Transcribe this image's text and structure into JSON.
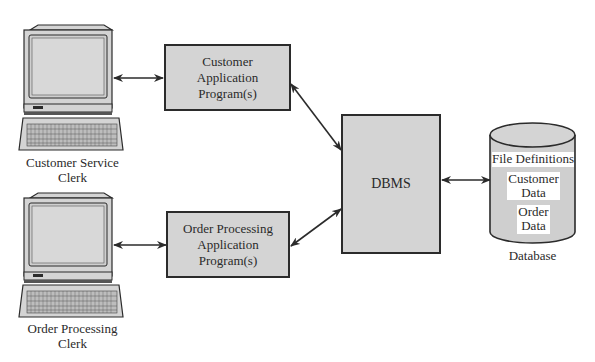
{
  "diagram": {
    "terminals": [
      {
        "id": "customer-service",
        "label_line1": "Customer Service",
        "label_line2": "Clerk"
      },
      {
        "id": "order-processing",
        "label_line1": "Order Processing",
        "label_line2": "Clerk"
      }
    ],
    "programs": [
      {
        "id": "customer-app",
        "line1": "Customer",
        "line2": "Application",
        "line3": "Program(s)"
      },
      {
        "id": "order-app",
        "line1": "Order Processing",
        "line2": "Application",
        "line3": "Program(s)"
      }
    ],
    "dbms": {
      "label": "DBMS"
    },
    "database": {
      "label": "Database",
      "contents": {
        "file_definitions": "File Definitions",
        "customer_data_line1": "Customer",
        "customer_data_line2": "Data",
        "order_data_line1": "Order",
        "order_data_line2": "Data"
      }
    },
    "colors": {
      "box_fill": "#d4d4d4",
      "stroke": "#2b2b2b",
      "background": "#ffffff"
    },
    "connections": [
      {
        "from": "Customer Service Clerk",
        "to": "Customer Application Program(s)",
        "type": "bidirectional"
      },
      {
        "from": "Order Processing Clerk",
        "to": "Order Processing Application Program(s)",
        "type": "bidirectional"
      },
      {
        "from": "Customer Application Program(s)",
        "to": "DBMS",
        "type": "bidirectional"
      },
      {
        "from": "Order Processing Application Program(s)",
        "to": "DBMS",
        "type": "bidirectional"
      },
      {
        "from": "DBMS",
        "to": "Database",
        "type": "bidirectional"
      }
    ]
  }
}
